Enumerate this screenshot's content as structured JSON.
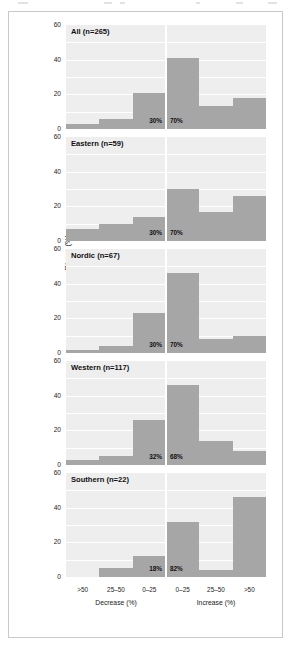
{
  "figure": {
    "y_axis_title": "Rivers (%)",
    "y_ticks": [
      "0",
      "20",
      "40",
      "60"
    ],
    "x_tick_labels": [
      ">50",
      "25–50",
      "0–25",
      "0–25",
      "25–50",
      ">50"
    ],
    "x_group_labels": [
      "Decrease (%)",
      "Increase (%)"
    ],
    "bar_color": "#a6a6a6",
    "plot_background": "#eeeeee",
    "gridline_color": "#ffffff",
    "frame_color": "#c9c9c9"
  },
  "chart_data": {
    "type": "bar",
    "title": "",
    "xlabel": "Decrease (%) / Increase (%)",
    "ylabel": "Rivers (%)",
    "ylim": [
      0,
      60
    ],
    "yticks": [
      0,
      20,
      40,
      60
    ],
    "grid": true,
    "legend": "none",
    "categories": [
      ">50",
      "25-50",
      "0-25",
      "0-25",
      "25-50",
      ">50"
    ],
    "category_groups": [
      "Decrease (%)",
      "Decrease (%)",
      "Decrease (%)",
      "Increase (%)",
      "Increase (%)",
      "Increase (%)"
    ],
    "panels": [
      {
        "label": "All (n=265)",
        "name": "All",
        "n": 265,
        "values": [
          3,
          6,
          21,
          41,
          13,
          18
        ],
        "decrease_pct": "30%",
        "increase_pct": "70%"
      },
      {
        "label": "Eastern (n=59)",
        "name": "Eastern",
        "n": 59,
        "values": [
          7,
          10,
          14,
          30,
          17,
          26
        ],
        "decrease_pct": "30%",
        "increase_pct": "70%"
      },
      {
        "label": "Nordic (n=67)",
        "name": "Nordic",
        "n": 67,
        "values": [
          2,
          4,
          23,
          46,
          8,
          10
        ],
        "decrease_pct": "30%",
        "increase_pct": "70%"
      },
      {
        "label": "Western (n=117)",
        "name": "Western",
        "n": 117,
        "values": [
          3,
          5,
          26,
          46,
          14,
          8
        ],
        "decrease_pct": "32%",
        "increase_pct": "68%"
      },
      {
        "label": "Southern (n=22)",
        "name": "Southern",
        "n": 22,
        "values": [
          0,
          5,
          12,
          32,
          4,
          46
        ],
        "decrease_pct": "18%",
        "increase_pct": "82%"
      }
    ]
  }
}
